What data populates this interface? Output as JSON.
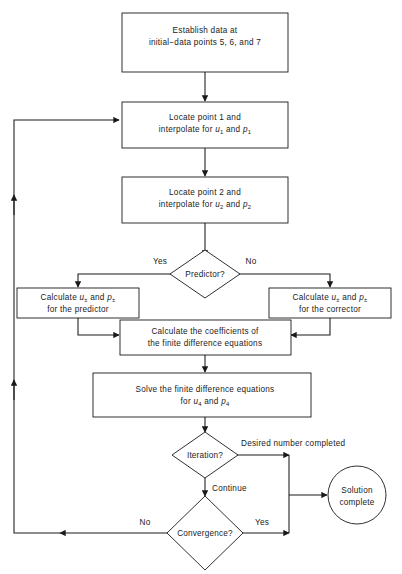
{
  "diagram": {
    "colors": {
      "stroke": "#1a1a1a",
      "fill": "#ffffff",
      "background": "#ffffff"
    },
    "nodes": {
      "establish": {
        "shape": "process",
        "line1": "Establish data at",
        "line2": "initial−data points 5, 6, and 7"
      },
      "locate1": {
        "shape": "process",
        "line1": "Locate point 1 and",
        "line2_pre": "interpolate for ",
        "line2_var1": "u",
        "line2_sub1": "1",
        "line2_mid": " and ",
        "line2_var2": "p",
        "line2_sub2": "1"
      },
      "locate2": {
        "shape": "process",
        "line1": "Locate point 2 and",
        "line2_pre": "interpolate for ",
        "line2_var1": "u",
        "line2_sub1": "2",
        "line2_mid": " and ",
        "line2_var2": "p",
        "line2_sub2": "2"
      },
      "predictor_decision": {
        "shape": "decision",
        "label": "Predictor?"
      },
      "calc_predictor": {
        "shape": "process",
        "line1_pre": "Calculate ",
        "line1_var1": "u",
        "line1_sub1": "±",
        "line1_mid": " and ",
        "line1_var2": "p",
        "line1_sub2": "±",
        "line2": "for the predictor"
      },
      "calc_corrector": {
        "shape": "process",
        "line1_pre": "Calculate ",
        "line1_var1": "u",
        "line1_sub1": "±",
        "line1_mid": " and ",
        "line1_var2": "p",
        "line1_sub2": "±",
        "line2": "for the corrector"
      },
      "coefficients": {
        "shape": "process",
        "line1": "Calculate the coefficients of",
        "line2": "the finite difference equations"
      },
      "solve": {
        "shape": "process",
        "line1": "Solve the finite difference equations",
        "line2_pre": "for ",
        "line2_var1": "u",
        "line2_sub1": "4",
        "line2_mid": " and ",
        "line2_var2": "p",
        "line2_sub2": "4"
      },
      "iteration_decision": {
        "shape": "decision",
        "label": "Iteration?"
      },
      "convergence_decision": {
        "shape": "decision",
        "label": "Convergence?"
      },
      "solution_complete": {
        "shape": "terminator-circle",
        "line1": "Solution",
        "line2": "complete"
      }
    },
    "edge_labels": {
      "predictor_yes": "Yes",
      "predictor_no": "No",
      "iteration_done": "Desired number completed",
      "iteration_continue": "Continue",
      "convergence_no": "No",
      "convergence_yes": "Yes"
    }
  }
}
